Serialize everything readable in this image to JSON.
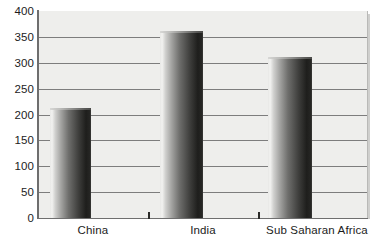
{
  "chart_data": {
    "type": "bar",
    "title": "",
    "subtitle": "",
    "xlabel": "",
    "ylabel": "",
    "categories": [
      "China",
      "India",
      "Sub Saharan Africa"
    ],
    "values": [
      210,
      360,
      310
    ],
    "ylim": [
      0,
      400
    ],
    "y_ticks": [
      0,
      50,
      100,
      150,
      200,
      250,
      300,
      350,
      400
    ],
    "y_tick_labels": [
      "0",
      "50",
      "100",
      "150",
      "200",
      "250",
      "300",
      "350",
      "400"
    ],
    "grid": true,
    "legend": false,
    "legend_position": "none",
    "series": [
      {
        "name": "",
        "values": [
          210,
          360,
          310
        ]
      }
    ],
    "annotations": []
  },
  "style": {
    "plot_background": "#eeeeec",
    "page_background": "#ffffff",
    "gridline_color": "#7d7d7d",
    "axis_color": "#6e6e6e",
    "text_color": "#1c1c1c",
    "bar_light": "#f2f2f0",
    "bar_dark": "#1e1e1c"
  }
}
